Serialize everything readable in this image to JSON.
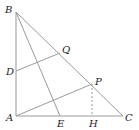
{
  "diagram": {
    "type": "geometry",
    "points": {
      "A": {
        "label": "A",
        "x": 16,
        "y": 116
      },
      "B": {
        "label": "B",
        "x": 16,
        "y": 12
      },
      "C": {
        "label": "C",
        "x": 123,
        "y": 116
      },
      "D": {
        "label": "D",
        "x": 16,
        "y": 71
      },
      "E": {
        "label": "E",
        "x": 60,
        "y": 116
      },
      "H": {
        "label": "H",
        "x": 92,
        "y": 116
      },
      "P": {
        "label": "P",
        "x": 92,
        "y": 84
      },
      "Q": {
        "label": "Q",
        "x": 60,
        "y": 53
      }
    },
    "segments": [
      {
        "from": "A",
        "to": "B",
        "style": "solid"
      },
      {
        "from": "A",
        "to": "C",
        "style": "solid"
      },
      {
        "from": "B",
        "to": "C",
        "style": "solid"
      },
      {
        "from": "B",
        "to": "E",
        "style": "solid"
      },
      {
        "from": "D",
        "to": "Q",
        "style": "solid"
      },
      {
        "from": "A",
        "to": "P",
        "style": "solid"
      },
      {
        "from": "P",
        "to": "H",
        "style": "dashed"
      }
    ],
    "colors": {
      "line": "#9a9a9a",
      "text": "#222222"
    }
  }
}
